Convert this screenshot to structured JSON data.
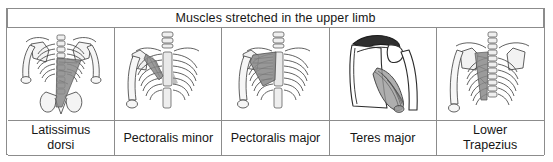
{
  "figure": {
    "title": "Muscles stretched in the upper limb",
    "border_color": "#8c8c8c",
    "background_color": "#ffffff",
    "text_color": "#161616",
    "muscle_shade_color": "#8a8a8a",
    "bone_fill_color": "#f2f2f2",
    "outline_color": "#333333",
    "columns": [
      {
        "caption_line1": "Latissimus",
        "caption_line2": "dorsi",
        "illustration": "posterior-thorax-latissimus-dorsi"
      },
      {
        "caption_line1": "Pectoralis minor",
        "caption_line2": "",
        "illustration": "anterior-ribcage-pectoralis-minor"
      },
      {
        "caption_line1": "Pectoralis major",
        "caption_line2": "",
        "illustration": "anterior-ribcage-pectoralis-major"
      },
      {
        "caption_line1": "Teres major",
        "caption_line2": "",
        "illustration": "scapula-humerus-teres-major"
      },
      {
        "caption_line1": "Lower",
        "caption_line2": "Trapezius",
        "illustration": "posterior-thorax-lower-trapezius"
      }
    ]
  }
}
